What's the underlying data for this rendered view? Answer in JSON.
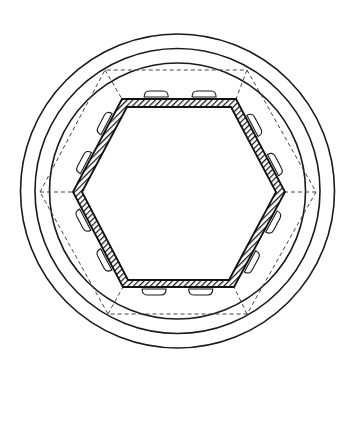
{
  "figure": {
    "title": "",
    "background": "#ffffff",
    "stroke_color": "#1a1a1a",
    "center": [
      177.5,
      191
    ],
    "circles": [
      {
        "id": "outer-circle",
        "r": 157
      },
      {
        "id": "middle-circle",
        "r": 142.5
      },
      {
        "id": "inner-circle",
        "r": 128
      }
    ],
    "dashed_hexagon": {
      "points": [
        [
          40,
          192
        ],
        [
          105,
          70
        ],
        [
          247,
          70
        ],
        [
          316,
          192
        ],
        [
          247,
          314
        ],
        [
          108,
          314
        ]
      ]
    },
    "solid_hexagon_outer": {
      "points": [
        [
          73,
          192
        ],
        [
          122,
          99
        ],
        [
          236,
          99
        ],
        [
          285,
          192
        ],
        [
          234,
          287
        ],
        [
          123,
          287
        ]
      ]
    },
    "solid_hexagon_inner": {
      "points": [
        [
          82,
          192
        ],
        [
          127,
          107
        ],
        [
          231,
          107
        ],
        [
          276,
          192
        ],
        [
          229,
          280
        ],
        [
          128,
          280
        ]
      ]
    },
    "tabs_per_side": 2,
    "labels": []
  }
}
